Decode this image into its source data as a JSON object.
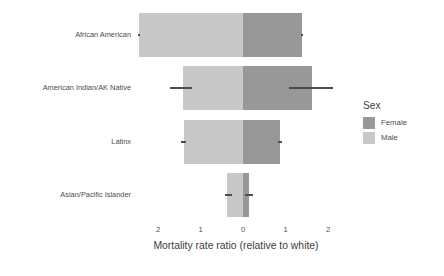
{
  "chart_data": {
    "type": "bar",
    "title": "",
    "subtitle": "",
    "xlabel": "Mortality rate ratio (relative to white)",
    "ylabel": "",
    "orientation": "horizontal-diverging",
    "grid": false,
    "xlim": [
      -2.6,
      2.6
    ],
    "xticks": [
      -2,
      -1,
      0,
      1,
      2
    ],
    "xticklabels": [
      "2",
      "1",
      "0",
      "1",
      "2"
    ],
    "note_axis": "Diverging axis: Male bars extend left from 0, Female bars extend right from 0; left side tick labels are shown as positive magnitudes.",
    "categories": [
      "African American",
      "American Indian/AK Native",
      "Latinx",
      "Asian/Pacific Islander"
    ],
    "legend": {
      "title": "Sex",
      "position": "right",
      "entries": [
        {
          "name": "Female",
          "color": "#989898"
        },
        {
          "name": "Male",
          "color": "#c8c8c8"
        }
      ]
    },
    "series": [
      {
        "name": "Male",
        "color": "#c8c8c8",
        "direction": "left",
        "values": [
          2.45,
          1.41,
          1.39,
          0.38
        ],
        "ci_low": [
          2.42,
          1.2,
          1.33,
          0.26
        ],
        "ci_high": [
          2.48,
          1.72,
          1.45,
          0.42
        ]
      },
      {
        "name": "Female",
        "color": "#989898",
        "direction": "right",
        "values": [
          1.39,
          1.62,
          0.87,
          0.14
        ],
        "ci_low": [
          1.36,
          1.08,
          0.82,
          0.05
        ],
        "ci_high": [
          1.42,
          2.12,
          0.92,
          0.24
        ]
      }
    ]
  },
  "axis": {
    "x_title": "Mortality rate ratio (relative to white)",
    "tick_labels": [
      "2",
      "1",
      "0",
      "1",
      "2"
    ]
  },
  "legend": {
    "title": "Sex",
    "items": [
      {
        "label": "Female",
        "color": "#989898"
      },
      {
        "label": "Male",
        "color": "#c8c8c8"
      }
    ]
  },
  "categories": [
    {
      "label": "African American"
    },
    {
      "label": "American Indian/AK Native"
    },
    {
      "label": "Latinx"
    },
    {
      "label": "Asian/Pacific Islander"
    }
  ],
  "colors": {
    "female": "#989898",
    "male": "#c8c8c8",
    "text": "#4d4d4d",
    "background": "#ffffff",
    "errorbar": "#4d4d4d"
  }
}
